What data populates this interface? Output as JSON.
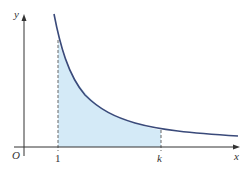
{
  "diagram": {
    "type": "function-graph",
    "axes": {
      "x_label": "x",
      "y_label": "y",
      "origin_label": "O"
    },
    "ticks": {
      "left_bound": "1",
      "right_bound": "k"
    },
    "colors": {
      "curve": "#3a4a7a",
      "shade": "#d4eaf7",
      "axis": "#333333",
      "dashed": "#666666"
    }
  }
}
